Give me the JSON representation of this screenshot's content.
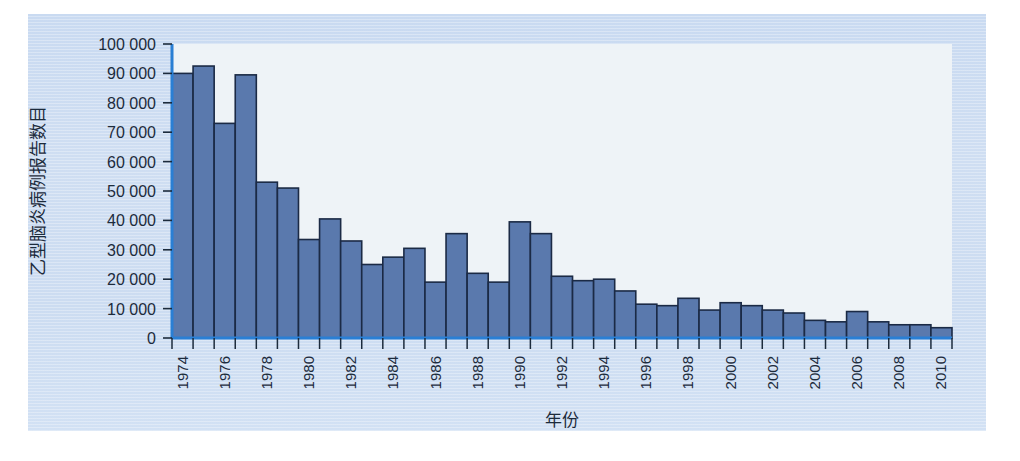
{
  "chart_data": {
    "type": "bar",
    "title": "",
    "xlabel": "年份",
    "ylabel": "乙型脑炎病例报告数目",
    "ylim": [
      0,
      100000
    ],
    "ytick_values": [
      0,
      10000,
      20000,
      30000,
      40000,
      50000,
      60000,
      70000,
      80000,
      90000,
      100000
    ],
    "ytick_labels": [
      "0",
      "10 000",
      "20 000",
      "30 000",
      "40 000",
      "50 000",
      "60 000",
      "70 000",
      "80 000",
      "90 000",
      "100 000"
    ],
    "xtick_labels": [
      "1974",
      "1976",
      "1978",
      "1980",
      "1982",
      "1984",
      "1986",
      "1988",
      "1990",
      "1992",
      "1994",
      "1996",
      "1998",
      "2000",
      "2002",
      "2004",
      "2006",
      "2008",
      "2010"
    ],
    "grid": false,
    "legend": "none",
    "categories": [
      "1974",
      "1975",
      "1976",
      "1977",
      "1978",
      "1979",
      "1980",
      "1981",
      "1982",
      "1983",
      "1984",
      "1985",
      "1986",
      "1987",
      "1988",
      "1989",
      "1990",
      "1991",
      "1992",
      "1993",
      "1994",
      "1995",
      "1996",
      "1997",
      "1998",
      "1999",
      "2000",
      "2001",
      "2002",
      "2003",
      "2004",
      "2005",
      "2006",
      "2007",
      "2008",
      "2009",
      "2010"
    ],
    "values": [
      90000,
      92500,
      73000,
      89500,
      53000,
      51000,
      33500,
      40500,
      33000,
      25000,
      27500,
      30500,
      19000,
      35500,
      22000,
      19000,
      39500,
      35500,
      21000,
      19500,
      20000,
      16000,
      11500,
      11000,
      13500,
      9500,
      12000,
      11000,
      9500,
      8500,
      6000,
      5500,
      9000,
      5500,
      4500,
      4500,
      3500
    ],
    "colors": {
      "bar_fill": "#5a79ad",
      "bar_edge": "#1b2a45",
      "axis_line": "#2a7fd4",
      "plot_background": "#eef3f7",
      "panel_background": "#cfdef2",
      "text": "#1c2b3c"
    }
  }
}
